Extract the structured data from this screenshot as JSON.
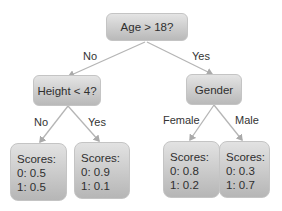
{
  "diagram": {
    "type": "decision-tree",
    "root": {
      "label": "Age > 18?",
      "edges": {
        "left": "No",
        "right": "Yes"
      }
    },
    "left_node": {
      "label": "Height < 4?",
      "edges": {
        "left": "No",
        "right": "Yes"
      },
      "leaves": [
        {
          "title": "Scores:",
          "line0": "0: 0.5",
          "line1": "1: 0.5"
        },
        {
          "title": "Scores:",
          "line0": "0: 0.9",
          "line1": "1: 0.1"
        }
      ]
    },
    "right_node": {
      "label": "Gender",
      "edges": {
        "left": "Female",
        "right": "Male"
      },
      "leaves": [
        {
          "title": "Scores:",
          "line0": "0: 0.8",
          "line1": "1: 0.2"
        },
        {
          "title": "Scores:",
          "line0": "0: 0.3",
          "line1": "1: 0.7"
        }
      ]
    }
  }
}
